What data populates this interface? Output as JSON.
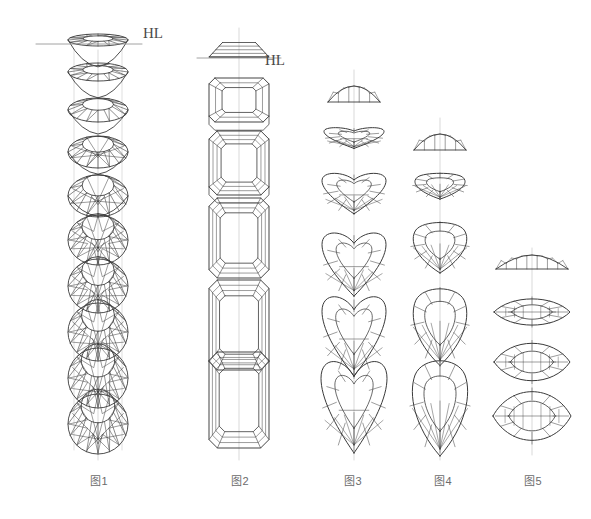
{
  "page": {
    "width": 591,
    "height": 519,
    "background": "#ffffff",
    "ink": "#3a3a3a",
    "guide_color": "#c9c9c9",
    "label_color": "#6b6b6b"
  },
  "annotations": {
    "horizon_labels": [
      {
        "text": "HL",
        "x": 143,
        "y": 25,
        "name": "horizon-line-label-1"
      },
      {
        "text": "HL",
        "x": 265,
        "y": 52,
        "name": "horizon-line-label-2"
      }
    ],
    "horizon_lines": [
      {
        "x1": 36,
        "x2": 142,
        "y": 44,
        "name": "horizon-line-1"
      },
      {
        "x1": 197,
        "x2": 281,
        "y": 58,
        "name": "horizon-line-2"
      }
    ]
  },
  "figures": [
    {
      "id": "fig1",
      "label": "图1",
      "label_x": 90,
      "label_y": 472,
      "shape": "round-brilliant",
      "axis_x": 98,
      "axis_top": 50,
      "axis_bottom": 460,
      "guides": [
        74,
        122
      ],
      "guide_top": 50,
      "guide_bottom": 450,
      "views": [
        {
          "cy": 40,
          "rx": 30,
          "ry": 6,
          "tilt": 0.0,
          "name": "view-edge-on"
        },
        {
          "cy": 72,
          "rx": 30,
          "ry": 9,
          "tilt": 0.12,
          "name": "view-tilt-1"
        },
        {
          "cy": 110,
          "rx": 30,
          "ry": 12,
          "tilt": 0.25,
          "name": "view-tilt-2"
        },
        {
          "cy": 152,
          "rx": 30,
          "ry": 16,
          "tilt": 0.38,
          "name": "view-tilt-3"
        },
        {
          "cy": 196,
          "rx": 30,
          "ry": 21,
          "tilt": 0.5,
          "name": "view-tilt-4"
        },
        {
          "cy": 240,
          "rx": 30,
          "ry": 25,
          "tilt": 0.62,
          "name": "view-tilt-5"
        },
        {
          "cy": 286,
          "rx": 30,
          "ry": 27,
          "tilt": 0.74,
          "name": "view-tilt-6"
        },
        {
          "cy": 332,
          "rx": 30,
          "ry": 29,
          "tilt": 0.84,
          "name": "view-tilt-7"
        },
        {
          "cy": 378,
          "rx": 30,
          "ry": 30,
          "tilt": 0.93,
          "name": "view-tilt-8"
        },
        {
          "cy": 424,
          "rx": 30,
          "ry": 30,
          "tilt": 1.0,
          "name": "view-face-up"
        }
      ]
    },
    {
      "id": "fig2",
      "label": "图2",
      "label_x": 231,
      "label_y": 472,
      "shape": "emerald-cut",
      "axis_x": 239,
      "axis_top": 28,
      "axis_bottom": 460,
      "guides": [],
      "guide_top": 0,
      "guide_bottom": 0,
      "views": [
        {
          "cy": 48,
          "hw": 30,
          "hh": 10,
          "tilt": 0.0,
          "name": "view-edge-on"
        },
        {
          "cy": 100,
          "hw": 30,
          "hh": 22,
          "tilt": 0.32,
          "name": "view-tilt-1"
        },
        {
          "cy": 163,
          "hw": 30,
          "hh": 32,
          "tilt": 0.55,
          "name": "view-tilt-2"
        },
        {
          "cy": 238,
          "hw": 30,
          "hh": 40,
          "tilt": 0.78,
          "name": "view-tilt-3"
        },
        {
          "cy": 325,
          "hw": 30,
          "hh": 45,
          "tilt": 0.92,
          "name": "view-tilt-4"
        },
        {
          "cy": 400,
          "hw": 30,
          "hh": 48,
          "tilt": 1.0,
          "name": "view-face-up"
        }
      ]
    },
    {
      "id": "fig3",
      "label": "图3",
      "label_x": 344,
      "label_y": 472,
      "shape": "heart-cut",
      "axis_x": 354,
      "axis_top": 70,
      "axis_bottom": 460,
      "guides": [],
      "guide_top": 0,
      "guide_bottom": 0,
      "views": [
        {
          "cy": 94,
          "hw": 26,
          "hh": 8,
          "tilt": 0.0,
          "name": "view-edge-on"
        },
        {
          "cy": 148,
          "hw": 30,
          "hh": 20,
          "tilt": 0.3,
          "name": "view-tilt-1"
        },
        {
          "cy": 204,
          "hw": 32,
          "hh": 30,
          "tilt": 0.52,
          "name": "view-tilt-2"
        },
        {
          "cy": 272,
          "hw": 32,
          "hh": 38,
          "tilt": 0.74,
          "name": "view-tilt-3"
        },
        {
          "cy": 340,
          "hw": 32,
          "hh": 42,
          "tilt": 0.9,
          "name": "view-tilt-4"
        },
        {
          "cy": 408,
          "hw": 33,
          "hh": 45,
          "tilt": 1.0,
          "name": "view-face-up"
        }
      ]
    },
    {
      "id": "fig4",
      "label": "图4",
      "label_x": 434,
      "label_y": 472,
      "shape": "pear-cut",
      "axis_x": 440,
      "axis_top": 118,
      "axis_bottom": 460,
      "guides": [],
      "guide_top": 0,
      "guide_bottom": 0,
      "views": [
        {
          "cy": 142,
          "hw": 26,
          "hh": 8,
          "tilt": 0.0,
          "name": "view-edge-on"
        },
        {
          "cy": 196,
          "hw": 29,
          "hh": 24,
          "tilt": 0.34,
          "name": "view-tilt-1"
        },
        {
          "cy": 256,
          "hw": 31,
          "hh": 36,
          "tilt": 0.6,
          "name": "view-tilt-2"
        },
        {
          "cy": 330,
          "hw": 31,
          "hh": 45,
          "tilt": 0.84,
          "name": "view-tilt-3"
        },
        {
          "cy": 406,
          "hw": 32,
          "hh": 50,
          "tilt": 1.0,
          "name": "view-face-up"
        }
      ]
    },
    {
      "id": "fig5",
      "label": "图5",
      "label_x": 524,
      "label_y": 472,
      "shape": "marquise-cut",
      "axis_x": 532,
      "axis_top": 248,
      "axis_bottom": 455,
      "guides": [],
      "guide_top": 0,
      "guide_bottom": 0,
      "views": [
        {
          "cy": 262,
          "hw": 36,
          "hh": 7,
          "tilt": 0.0,
          "name": "view-edge-on"
        },
        {
          "cy": 312,
          "hw": 38,
          "hh": 14,
          "tilt": 0.4,
          "name": "view-tilt-1"
        },
        {
          "cy": 362,
          "hw": 38,
          "hh": 20,
          "tilt": 0.7,
          "name": "view-tilt-2"
        },
        {
          "cy": 416,
          "hw": 39,
          "hh": 26,
          "tilt": 1.0,
          "name": "view-face-up"
        }
      ]
    }
  ]
}
